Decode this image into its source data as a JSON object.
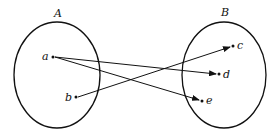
{
  "diagram": {
    "type": "mapping",
    "sets": [
      {
        "id": "A",
        "label": "A",
        "elements": [
          "a",
          "b"
        ]
      },
      {
        "id": "B",
        "label": "B",
        "elements": [
          "c",
          "d",
          "e"
        ]
      }
    ],
    "points": {
      "a": {
        "label": "a"
      },
      "b": {
        "label": "b"
      },
      "c": {
        "label": "c"
      },
      "d": {
        "label": "d"
      },
      "e": {
        "label": "e"
      }
    },
    "arrows": [
      {
        "from": "a",
        "to": "d"
      },
      {
        "from": "a",
        "to": "e"
      },
      {
        "from": "b",
        "to": "c"
      }
    ],
    "colors": {
      "stroke": "#111111",
      "background": "#ffffff"
    }
  }
}
